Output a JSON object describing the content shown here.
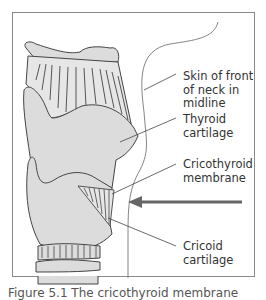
{
  "figure": {
    "labels": {
      "skin": [
        "Skin of front",
        "of neck in",
        "midline"
      ],
      "thyroid": [
        "Thyroid",
        "cartilage"
      ],
      "membrane": [
        "Cricothyroid",
        "membrane"
      ],
      "cricoid": [
        "Cricoid",
        "cartilage"
      ]
    },
    "caption": "Figure 5.1 The cricothyroid membrane",
    "colors": {
      "cartilage_fill": "#dcdcdc",
      "outline": "#444444",
      "arrow": "#666666",
      "frame": "#8a8a8a"
    }
  }
}
